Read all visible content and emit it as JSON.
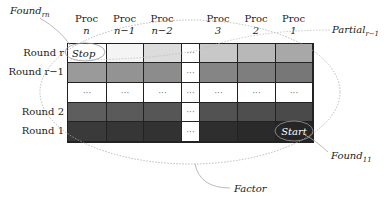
{
  "labels": {
    "found_rn": {
      "base": "Found",
      "sub": "rn"
    },
    "partial": {
      "base": "Partial",
      "sub": "r−1"
    },
    "found_11": {
      "base": "Found",
      "sub": "11"
    },
    "factor": "Factor"
  },
  "columns": [
    {
      "top": "Proc",
      "bottom": "n"
    },
    {
      "top": "Proc",
      "bottom": "n−1"
    },
    {
      "top": "Proc",
      "bottom": "n−2"
    },
    {
      "top": "",
      "bottom": ""
    },
    {
      "top": "Proc",
      "bottom": "3"
    },
    {
      "top": "Proc",
      "bottom": "2"
    },
    {
      "top": "Proc",
      "bottom": "1"
    }
  ],
  "rows": [
    {
      "label": "Round r",
      "cells": [
        "Stop",
        "",
        "",
        "···",
        "",
        "",
        ""
      ],
      "colors": [
        "#ffffff",
        "#f4f4f4",
        "#dcdcdc",
        "#ffffff",
        "#c8c8c8",
        "#b8b8b8",
        "#a8a8a8"
      ]
    },
    {
      "label": "Round r−1",
      "cells": [
        "",
        "",
        "",
        "···",
        "",
        "",
        ""
      ],
      "colors": [
        "#9a9a9a",
        "#939393",
        "#8c8c8c",
        "#ffffff",
        "#858585",
        "#7e7e7e",
        "#777777"
      ]
    },
    {
      "label": "",
      "cells": [
        "···",
        "···",
        "···",
        "···",
        "···",
        "···",
        "···"
      ],
      "colors": [
        "#ffffff",
        "#ffffff",
        "#ffffff",
        "#ffffff",
        "#ffffff",
        "#ffffff",
        "#ffffff"
      ]
    },
    {
      "label": "Round 2",
      "cells": [
        "",
        "",
        "",
        "···",
        "",
        "",
        ""
      ],
      "colors": [
        "#5e5e5e",
        "#5a5a5a",
        "#565656",
        "#ffffff",
        "#525252",
        "#4e4e4e",
        "#4a4a4a"
      ]
    },
    {
      "label": "Round 1",
      "cells": [
        "",
        "",
        "",
        "···",
        "",
        "",
        "Start"
      ],
      "colors": [
        "#3a3a3a",
        "#363636",
        "#323232",
        "#ffffff",
        "#2e2e2e",
        "#2a2a2a",
        "#262626"
      ]
    }
  ]
}
